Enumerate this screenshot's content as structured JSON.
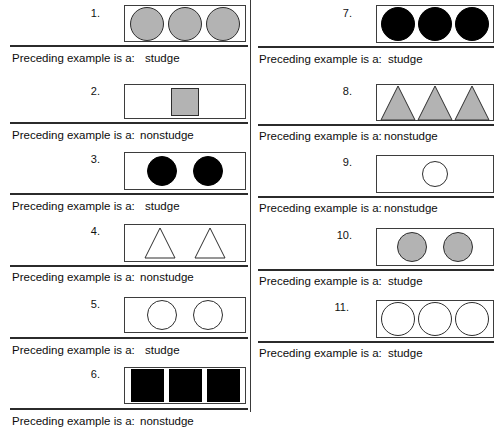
{
  "worksheet": {
    "answer_prompt": "Preceding example is a:",
    "fill_gray": "#b3b3b3",
    "fill_black": "#000000",
    "fill_white": "#ffffff",
    "stroke": "#3d3d3d"
  },
  "columns": [
    {
      "name": "left-column",
      "examples": [
        {
          "number": "1.",
          "answer": "studge",
          "shape": "circle",
          "fill": "gray",
          "count": 3
        },
        {
          "number": "2.",
          "answer": "nonstudge",
          "shape": "square",
          "fill": "gray",
          "count": 1
        },
        {
          "number": "3.",
          "answer": "studge",
          "shape": "circle",
          "fill": "black",
          "count": 2
        },
        {
          "number": "4.",
          "answer": "nonstudge",
          "shape": "triangle",
          "fill": "white",
          "count": 2
        },
        {
          "number": "5.",
          "answer": "studge",
          "shape": "circle",
          "fill": "white",
          "count": 2
        },
        {
          "number": "6.",
          "answer": "nonstudge",
          "shape": "square",
          "fill": "black",
          "count": 3
        }
      ]
    },
    {
      "name": "right-column",
      "examples": [
        {
          "number": "7.",
          "answer": "studge",
          "shape": "circle",
          "fill": "black",
          "count": 3
        },
        {
          "number": "8.",
          "answer": "nonstudge",
          "shape": "triangle",
          "fill": "gray",
          "count": 3
        },
        {
          "number": "9.",
          "answer": "nonstudge",
          "shape": "circle",
          "fill": "white",
          "count": 1
        },
        {
          "number": "10.",
          "answer": "studge",
          "shape": "circle",
          "fill": "gray",
          "count": 2
        },
        {
          "number": "11.",
          "answer": "studge",
          "shape": "circle",
          "fill": "white",
          "count": 3
        }
      ]
    }
  ]
}
